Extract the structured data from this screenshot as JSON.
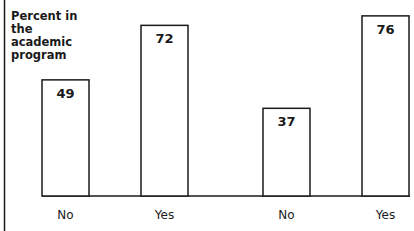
{
  "chart_data": {
    "type": "bar",
    "title": "",
    "xlabel": "",
    "ylabel": "Percent in\nthe\nacademic\nprogram",
    "categories": [
      "No",
      "Yes",
      "No",
      "Yes"
    ],
    "values": [
      49,
      72,
      37,
      76
    ],
    "data_labels": [
      "49",
      "72",
      "37",
      "76"
    ],
    "ylim": [
      0,
      100
    ],
    "grid": false,
    "legend": "none"
  }
}
